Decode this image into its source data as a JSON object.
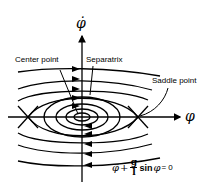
{
  "diagram": {
    "type": "phase-portrait",
    "axes": {
      "vertical_label": "φ̇",
      "horizontal_label": "φ"
    },
    "labels": {
      "center_point": "Center point",
      "separatrix": "Separatrix",
      "saddle_point": "Saddle point"
    },
    "equation": {
      "term1": "φ̈",
      "plus": "+",
      "numerator": "g",
      "denominator": "l",
      "sin": "sin",
      "var": "φ",
      "equals": "= 0"
    }
  }
}
